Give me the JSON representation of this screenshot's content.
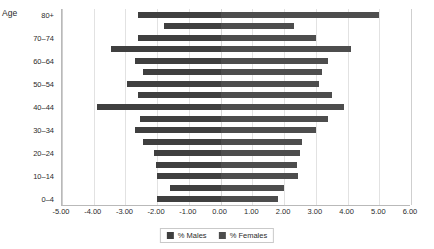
{
  "chart_data": {
    "type": "bar",
    "subtype": "population-pyramid",
    "title": "",
    "xlabel": "",
    "ylabel": "Age",
    "categories": [
      "0–4",
      "5–9",
      "10–14",
      "15–19",
      "20–24",
      "25–29",
      "30–34",
      "35–39",
      "40–44",
      "45–49",
      "50–54",
      "55–59",
      "60–64",
      "65–69",
      "70–74",
      "75–79",
      "80+"
    ],
    "series": [
      {
        "name": "% Males",
        "values": [
          -2.0,
          -1.6,
          -2.0,
          -2.05,
          -2.1,
          -2.45,
          -2.7,
          -2.55,
          -3.9,
          -2.6,
          -2.95,
          -2.45,
          -2.7,
          -3.45,
          -2.6,
          -1.8,
          -2.6
        ]
      },
      {
        "name": "% Females",
        "values": [
          1.8,
          2.0,
          2.45,
          2.4,
          2.5,
          2.55,
          3.0,
          3.4,
          3.9,
          3.5,
          3.1,
          3.2,
          3.4,
          4.1,
          3.0,
          2.3,
          5.0
        ]
      }
    ],
    "xlim": [
      -5.0,
      6.0
    ],
    "xticks": [
      -5.0,
      -4.0,
      -3.0,
      -2.0,
      -1.0,
      0.0,
      1.0,
      2.0,
      3.0,
      4.0,
      5.0,
      6.0
    ],
    "xtick_labels": [
      "-5.00",
      "-4.00",
      "-3.00",
      "-2.00",
      "-1.00",
      "0.00",
      "1.00",
      "2.00",
      "3.00",
      "4.00",
      "5.00",
      "6.00"
    ],
    "ytick_labels_shown": [
      "0–4",
      "10–14",
      "20–24",
      "30–34",
      "40–44",
      "50–54",
      "60–64",
      "70–74",
      "80+"
    ],
    "grid": true,
    "legend_position": "bottom",
    "colors": {
      "males": "#3f3f3f",
      "females": "#4d4d4d",
      "grid": "#e2e2e2",
      "axis": "#b9b9b9",
      "text": "#2b2b2b"
    }
  },
  "axis": {
    "y_title": "Age"
  },
  "legend": {
    "items": [
      {
        "label": "% Males"
      },
      {
        "label": "% Females"
      }
    ]
  }
}
